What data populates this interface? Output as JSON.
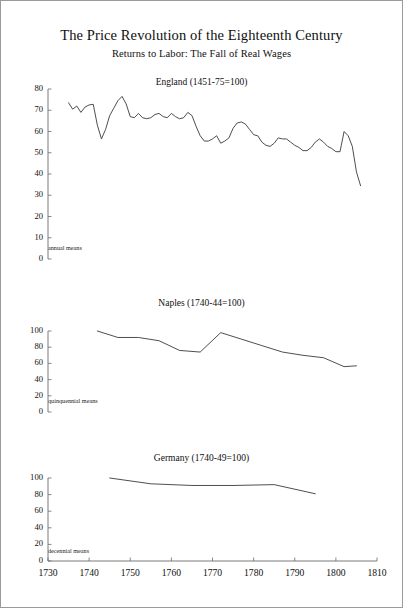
{
  "figure": {
    "title": "The Price Revolution of the Eighteenth Century",
    "subtitle": "Returns to Labor: The Fall of Real Wages"
  },
  "axis": {
    "x_ticks": [
      "1730",
      "1740",
      "1750",
      "1760",
      "1770",
      "1780",
      "1790",
      "1800",
      "1810"
    ]
  },
  "panels": {
    "england": {
      "title": "England (1451-75=100)",
      "note": "annual means",
      "y_ticks": [
        "80",
        "70",
        "60",
        "50",
        "40",
        "30",
        "20",
        "10",
        "0"
      ]
    },
    "naples": {
      "title": "Naples (1740-44=100)",
      "note": "quinquennial means",
      "y_ticks": [
        "100",
        "80",
        "60",
        "40",
        "20",
        "0"
      ]
    },
    "germany": {
      "title": "Germany (1740-49=100)",
      "note": "decennial means",
      "y_ticks": [
        "100",
        "80",
        "60",
        "40",
        "20",
        "0"
      ]
    }
  },
  "chart_data": [
    {
      "type": "line",
      "title": "England (1451-75=100)",
      "subtitle": "annual means",
      "xlabel": "",
      "ylabel": "",
      "xlim": [
        1730,
        1810
      ],
      "ylim": [
        0,
        80
      ],
      "grid": false,
      "legend": "none",
      "series": [
        {
          "name": "England real wage index (1451-75=100)",
          "x": [
            1735,
            1736,
            1737,
            1738,
            1739,
            1740,
            1741,
            1742,
            1743,
            1744,
            1745,
            1746,
            1747,
            1748,
            1749,
            1750,
            1751,
            1752,
            1753,
            1754,
            1755,
            1756,
            1757,
            1758,
            1759,
            1760,
            1761,
            1762,
            1763,
            1764,
            1765,
            1766,
            1767,
            1768,
            1769,
            1770,
            1771,
            1772,
            1773,
            1774,
            1775,
            1776,
            1777,
            1778,
            1779,
            1780,
            1781,
            1782,
            1783,
            1784,
            1785,
            1786,
            1787,
            1788,
            1789,
            1790,
            1791,
            1792,
            1793,
            1794,
            1795,
            1796,
            1797,
            1798,
            1799,
            1800,
            1801,
            1802,
            1803,
            1804,
            1805,
            1806
          ],
          "y": [
            73.5,
            70.5,
            72.0,
            69.0,
            71.5,
            72.5,
            72.8,
            63.0,
            56.5,
            61.0,
            67.5,
            71.0,
            74.5,
            76.5,
            73.0,
            67.0,
            66.5,
            68.5,
            66.5,
            66.0,
            66.5,
            68.0,
            68.5,
            67.0,
            66.5,
            68.5,
            67.0,
            66.0,
            66.5,
            69.0,
            67.5,
            62.5,
            58.0,
            55.5,
            55.5,
            56.5,
            58.0,
            54.5,
            55.5,
            57.0,
            61.5,
            64.0,
            64.5,
            63.5,
            61.0,
            58.5,
            58.0,
            55.0,
            53.5,
            53.0,
            54.5,
            57.0,
            56.5,
            56.5,
            55.0,
            53.5,
            52.5,
            51.0,
            51.0,
            52.5,
            55.0,
            56.5,
            55.0,
            53.0,
            52.0,
            50.5,
            50.5,
            60.0,
            58.0,
            53.0,
            41.0,
            34.5
          ],
          "color": "#3a3a3a"
        }
      ]
    },
    {
      "type": "line",
      "title": "Naples (1740-44=100)",
      "subtitle": "quinquennial means",
      "xlabel": "",
      "ylabel": "",
      "xlim": [
        1730,
        1810
      ],
      "ylim": [
        0,
        100
      ],
      "grid": false,
      "legend": "none",
      "series": [
        {
          "name": "Naples real wage index (1740-44=100)",
          "x": [
            1742,
            1747,
            1752,
            1757,
            1762,
            1767,
            1772,
            1777,
            1782,
            1787,
            1792,
            1797,
            1802,
            1805
          ],
          "y": [
            100,
            92,
            92,
            88,
            76,
            74,
            98,
            90,
            82,
            74,
            70,
            67,
            56,
            57
          ],
          "color": "#3a3a3a"
        }
      ]
    },
    {
      "type": "line",
      "title": "Germany (1740-49=100)",
      "subtitle": "decennial means",
      "xlabel": "",
      "ylabel": "",
      "xlim": [
        1730,
        1810
      ],
      "ylim": [
        0,
        100
      ],
      "grid": false,
      "legend": "none",
      "series": [
        {
          "name": "Germany real wage index (1740-49=100)",
          "x": [
            1745,
            1755,
            1765,
            1775,
            1785,
            1795
          ],
          "y": [
            100,
            93,
            91,
            91,
            92,
            81
          ],
          "color": "#3a3a3a"
        }
      ]
    }
  ]
}
